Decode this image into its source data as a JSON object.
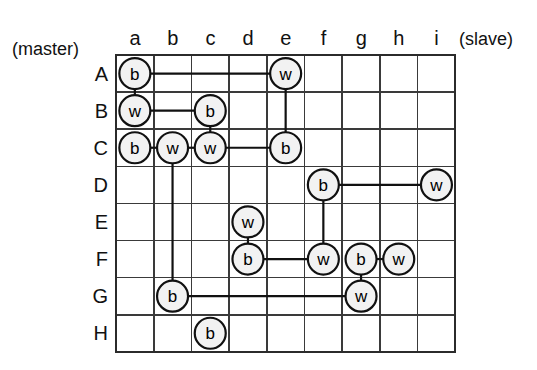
{
  "figure": {
    "title": "",
    "master_label": "(master)",
    "slave_label": "(slave)",
    "column_labels": [
      "a",
      "b",
      "c",
      "d",
      "e",
      "f",
      "g",
      "h",
      "i"
    ],
    "row_labels": [
      "A",
      "B",
      "C",
      "D",
      "E",
      "F",
      "G",
      "H"
    ],
    "colors": {
      "grid_line": "#3a3a3a",
      "grid_border": "#2b2b2b",
      "node_stroke": "#111111",
      "node_fill": "#f2f2f2",
      "link": "#111111",
      "background": "#ffffff"
    }
  },
  "chart_data": {
    "type": "scatter",
    "title": "",
    "xlabel": "(slave)",
    "ylabel": "(master)",
    "grid": true,
    "legend": "none",
    "columns": [
      "a",
      "b",
      "c",
      "d",
      "e",
      "f",
      "g",
      "h",
      "i"
    ],
    "rows": [
      "A",
      "B",
      "C",
      "D",
      "E",
      "F",
      "G",
      "H"
    ],
    "node_labels": [
      "b",
      "w"
    ],
    "nodes": [
      {
        "row": "A",
        "col": "a",
        "label": "b"
      },
      {
        "row": "A",
        "col": "e",
        "label": "w"
      },
      {
        "row": "B",
        "col": "a",
        "label": "w"
      },
      {
        "row": "B",
        "col": "c",
        "label": "b"
      },
      {
        "row": "C",
        "col": "a",
        "label": "b"
      },
      {
        "row": "C",
        "col": "b",
        "label": "w"
      },
      {
        "row": "C",
        "col": "c",
        "label": "w"
      },
      {
        "row": "C",
        "col": "e",
        "label": "b"
      },
      {
        "row": "D",
        "col": "f",
        "label": "b"
      },
      {
        "row": "D",
        "col": "i",
        "label": "w"
      },
      {
        "row": "E",
        "col": "d",
        "label": "w"
      },
      {
        "row": "F",
        "col": "d",
        "label": "b"
      },
      {
        "row": "F",
        "col": "f",
        "label": "w"
      },
      {
        "row": "F",
        "col": "g",
        "label": "b"
      },
      {
        "row": "F",
        "col": "h",
        "label": "w"
      },
      {
        "row": "G",
        "col": "b",
        "label": "b"
      },
      {
        "row": "G",
        "col": "g",
        "label": "w"
      },
      {
        "row": "H",
        "col": "c",
        "label": "b"
      }
    ],
    "edges": [
      {
        "from": {
          "row": "A",
          "col": "a"
        },
        "to": {
          "row": "A",
          "col": "e"
        },
        "orientation": "horizontal"
      },
      {
        "from": {
          "row": "A",
          "col": "a"
        },
        "to": {
          "row": "B",
          "col": "a"
        },
        "orientation": "vertical"
      },
      {
        "from": {
          "row": "A",
          "col": "e"
        },
        "to": {
          "row": "C",
          "col": "e"
        },
        "orientation": "vertical"
      },
      {
        "from": {
          "row": "B",
          "col": "a"
        },
        "to": {
          "row": "B",
          "col": "c"
        },
        "orientation": "horizontal"
      },
      {
        "from": {
          "row": "B",
          "col": "c"
        },
        "to": {
          "row": "C",
          "col": "c"
        },
        "orientation": "vertical"
      },
      {
        "from": {
          "row": "C",
          "col": "a"
        },
        "to": {
          "row": "C",
          "col": "b"
        },
        "orientation": "horizontal"
      },
      {
        "from": {
          "row": "C",
          "col": "b"
        },
        "to": {
          "row": "C",
          "col": "c"
        },
        "orientation": "horizontal"
      },
      {
        "from": {
          "row": "C",
          "col": "c"
        },
        "to": {
          "row": "C",
          "col": "e"
        },
        "orientation": "horizontal"
      },
      {
        "from": {
          "row": "C",
          "col": "b"
        },
        "to": {
          "row": "G",
          "col": "b"
        },
        "orientation": "vertical"
      },
      {
        "from": {
          "row": "D",
          "col": "f"
        },
        "to": {
          "row": "D",
          "col": "i"
        },
        "orientation": "horizontal"
      },
      {
        "from": {
          "row": "D",
          "col": "f"
        },
        "to": {
          "row": "F",
          "col": "f"
        },
        "orientation": "vertical"
      },
      {
        "from": {
          "row": "E",
          "col": "d"
        },
        "to": {
          "row": "F",
          "col": "d"
        },
        "orientation": "vertical"
      },
      {
        "from": {
          "row": "F",
          "col": "d"
        },
        "to": {
          "row": "F",
          "col": "f"
        },
        "orientation": "horizontal"
      },
      {
        "from": {
          "row": "F",
          "col": "g"
        },
        "to": {
          "row": "F",
          "col": "h"
        },
        "orientation": "horizontal"
      },
      {
        "from": {
          "row": "F",
          "col": "g"
        },
        "to": {
          "row": "G",
          "col": "g"
        },
        "orientation": "vertical"
      },
      {
        "from": {
          "row": "G",
          "col": "b"
        },
        "to": {
          "row": "G",
          "col": "g"
        },
        "orientation": "horizontal"
      }
    ]
  },
  "geometry": {
    "grid_left": 116,
    "grid_top": 55,
    "cell_width": 37.7,
    "cell_height": 37.1,
    "node_radius": 15.5
  }
}
